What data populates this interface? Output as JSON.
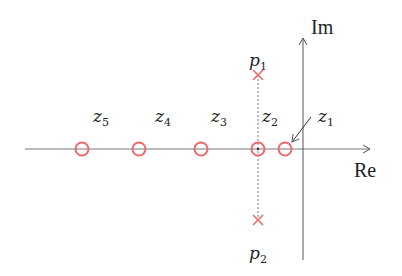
{
  "diagram": {
    "type": "pole-zero-plot",
    "axes": {
      "real_label": "Re",
      "imag_label": "Im"
    },
    "colors": {
      "marker": "#ea6b6b",
      "axis": "#555555",
      "text": "#222222"
    },
    "zeros": [
      {
        "name": "z",
        "sub": "1",
        "x": 285,
        "label_x": 318,
        "label_y": 122
      },
      {
        "name": "z",
        "sub": "2",
        "x": 258,
        "label_x": 262,
        "label_y": 122
      },
      {
        "name": "z",
        "sub": "3",
        "x": 201,
        "label_x": 211,
        "label_y": 122
      },
      {
        "name": "z",
        "sub": "4",
        "x": 139,
        "label_x": 155,
        "label_y": 122
      },
      {
        "name": "z",
        "sub": "5",
        "x": 82,
        "label_x": 93,
        "label_y": 122
      }
    ],
    "poles": [
      {
        "name": "p",
        "sub": "1",
        "y": 75,
        "label_y": 66
      },
      {
        "name": "p",
        "sub": "2",
        "y": 220,
        "label_y": 259
      }
    ]
  }
}
